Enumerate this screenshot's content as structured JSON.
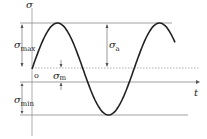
{
  "diagram": {
    "axes": {
      "vertical_label": "σ",
      "horizontal_label": "t",
      "origin_label": "o"
    },
    "labels": {
      "sigma_max": {
        "symbol": "σ",
        "subscript": "max"
      },
      "sigma_min": {
        "symbol": "σ",
        "subscript": "min"
      },
      "sigma_a": {
        "symbol": "σ",
        "subscript": "a"
      },
      "sigma_m": {
        "symbol": "σ",
        "subscript": "m"
      }
    },
    "curve": {
      "type": "sine",
      "cycles": 1.3,
      "levels": [
        "max",
        "mean",
        "min"
      ]
    },
    "colors": {
      "curve": "#222222",
      "guide_lines": "#888888",
      "dashed_lines": "#999999"
    }
  }
}
